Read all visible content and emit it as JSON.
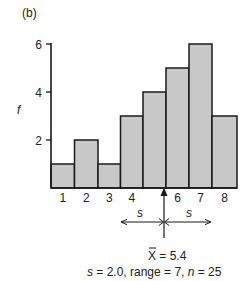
{
  "panel_label": "(b)",
  "chart_data": {
    "type": "bar",
    "title": "",
    "panel_label": "(b)",
    "xlabel": "",
    "ylabel": "f",
    "categories": [
      "1",
      "2",
      "3",
      "4",
      "5",
      "6",
      "7",
      "8"
    ],
    "x_tick_labels_shown": [
      "1",
      "2",
      "3",
      "4",
      "",
      "6",
      "7",
      "8"
    ],
    "values": [
      1,
      2,
      1,
      3,
      4,
      5,
      6,
      3
    ],
    "ylim": [
      0,
      6
    ],
    "y_ticks": [
      2,
      4,
      6
    ],
    "grid": false,
    "bar_color": "#c8c8c8",
    "bar_edge_color": "#1a1a1a",
    "annotations": {
      "mean_label": "X̄ = 5.4",
      "mean_value": 5.4,
      "sd_arrow_label_left": "s",
      "sd_arrow_label_right": "s",
      "summary": "s = 2.0, range = 7, n = 25"
    },
    "stats": {
      "mean": 5.4,
      "s": 2.0,
      "range": 7,
      "n": 25
    }
  },
  "labels": {
    "y_axis": "f",
    "mean_text": "X = 5.4",
    "s_left": "s",
    "s_right": "s",
    "summary_s": "s",
    "summary_rest_1": " = 2.0, range = 7, ",
    "summary_n": "n",
    "summary_rest_2": " = 25"
  }
}
